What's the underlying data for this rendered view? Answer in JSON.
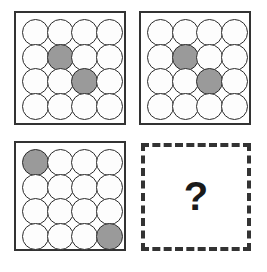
{
  "puzzle": {
    "type": "matrix-reasoning",
    "grid_layout": {
      "rows": 2,
      "cols": 2
    },
    "panel_grid": {
      "rows": 4,
      "cols": 4
    },
    "colors": {
      "background": "#ffffff",
      "panel_border": "#333333",
      "circle_outline": "#2b2b2b",
      "circle_empty_fill": "#fdfdfd",
      "circle_shaded_fill": "#9a9a9a",
      "question_mark": "#1a1a1a"
    },
    "panels": [
      {
        "id": "panel-1",
        "position": "top-left",
        "border_style": "solid",
        "shaded_cells": [
          {
            "row": 2,
            "col": 2
          },
          {
            "row": 3,
            "col": 3
          }
        ],
        "cells": [
          [
            "empty",
            "empty",
            "empty",
            "empty"
          ],
          [
            "empty",
            "shaded",
            "empty",
            "empty"
          ],
          [
            "empty",
            "empty",
            "shaded",
            "empty"
          ],
          [
            "empty",
            "empty",
            "empty",
            "empty"
          ]
        ]
      },
      {
        "id": "panel-2",
        "position": "top-right",
        "border_style": "solid",
        "shaded_cells": [
          {
            "row": 2,
            "col": 2
          },
          {
            "row": 3,
            "col": 3
          }
        ],
        "cells": [
          [
            "empty",
            "empty",
            "empty",
            "empty"
          ],
          [
            "empty",
            "shaded",
            "empty",
            "empty"
          ],
          [
            "empty",
            "empty",
            "shaded",
            "empty"
          ],
          [
            "empty",
            "empty",
            "empty",
            "empty"
          ]
        ]
      },
      {
        "id": "panel-3",
        "position": "bottom-left",
        "border_style": "solid",
        "shaded_cells": [
          {
            "row": 1,
            "col": 1
          },
          {
            "row": 4,
            "col": 4
          }
        ],
        "cells": [
          [
            "shaded",
            "empty",
            "empty",
            "empty"
          ],
          [
            "empty",
            "empty",
            "empty",
            "empty"
          ],
          [
            "empty",
            "empty",
            "empty",
            "empty"
          ],
          [
            "empty",
            "empty",
            "empty",
            "shaded"
          ]
        ]
      },
      {
        "id": "panel-4",
        "position": "bottom-right",
        "border_style": "dashed",
        "content": "question",
        "question_mark": "?"
      }
    ]
  }
}
